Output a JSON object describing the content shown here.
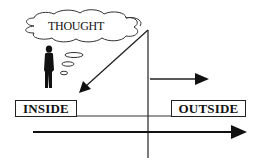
{
  "diagram": {
    "thought_bubble": {
      "text": "THOUGHT"
    },
    "labels": {
      "inside": "INSIDE",
      "outside": "OUTSIDE"
    },
    "elements": {
      "person": "person-silhouette-icon",
      "thought_bubbles": 3,
      "arrows": [
        "diagonal-arrow-to-inside",
        "upper-right-arrow",
        "bottom-right-arrow"
      ],
      "divider": "vertical-divider-line"
    },
    "colors": {
      "ink": "#111111",
      "background": "#ffffff"
    }
  }
}
